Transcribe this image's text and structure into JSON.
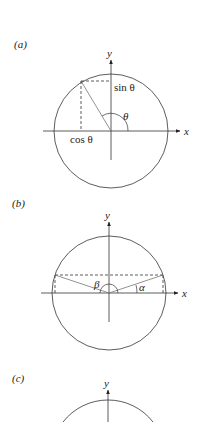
{
  "panels": [
    {
      "id": "a",
      "label": "(a)",
      "axis_x": "x",
      "axis_y": "y",
      "sin_label": "sin θ",
      "cos_label": "cos θ",
      "angle_label": "θ"
    },
    {
      "id": "b",
      "label": "(b)",
      "axis_x": "x",
      "axis_y": "y",
      "angle_beta": "β",
      "angle_alpha": "α"
    },
    {
      "id": "c",
      "label": "(c)",
      "axis_y": "y"
    }
  ],
  "colors": {
    "line": "#333333",
    "radius_line": "#777777",
    "background": "#ffffff"
  }
}
